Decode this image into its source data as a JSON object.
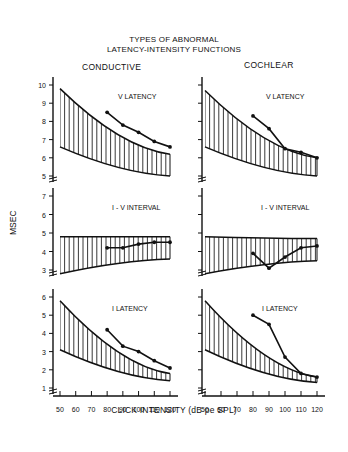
{
  "title": {
    "line1": "TYPES OF ABNORMAL",
    "line2": "LATENCY-INTENSITY FUNCTIONS"
  },
  "columns": {
    "left": "CONDUCTIVE",
    "right": "COCHLEAR"
  },
  "ylabel": "MSEC",
  "xlabel": "CLICK INTENSITY (dB pe SPL)",
  "x_ticks": [
    "50",
    "60",
    "70",
    "80",
    "90",
    "100",
    "110",
    "120"
  ],
  "panels": {
    "v": {
      "label": "V LATENCY",
      "ticks": [
        "10",
        "9",
        "8",
        "7",
        "6",
        "5"
      ]
    },
    "iv": {
      "label": "I - V INTERVAL",
      "ticks": [
        "7",
        "6",
        "5",
        "4",
        "3"
      ]
    },
    "i": {
      "label": "I LATENCY",
      "ticks": [
        "6",
        "5",
        "4",
        "3",
        "2",
        "1"
      ]
    }
  },
  "chart_data": [
    {
      "type": "line",
      "title": "CONDUCTIVE - V LATENCY",
      "xlabel": "CLICK INTENSITY (dB pe SPL)",
      "ylabel": "MSEC",
      "ylim": [
        5,
        10
      ],
      "x": [
        80,
        90,
        100,
        110,
        120
      ],
      "series": [
        {
          "name": "patient",
          "values": [
            8.5,
            7.8,
            7.4,
            6.9,
            6.6
          ]
        }
      ],
      "normal_range": {
        "x": [
          50,
          120
        ],
        "upper": [
          9.8,
          6.2
        ],
        "lower": [
          6.6,
          5.0
        ]
      }
    },
    {
      "type": "line",
      "title": "CONDUCTIVE - I - V INTERVAL",
      "ylim": [
        3,
        7
      ],
      "x": [
        80,
        90,
        100,
        110,
        120
      ],
      "series": [
        {
          "name": "patient",
          "values": [
            4.2,
            4.2,
            4.4,
            4.5,
            4.5
          ]
        }
      ],
      "normal_range": {
        "x": [
          50,
          120
        ],
        "upper": [
          4.8,
          4.8
        ],
        "lower": [
          2.8,
          3.6
        ]
      }
    },
    {
      "type": "line",
      "title": "CONDUCTIVE - I LATENCY",
      "ylim": [
        1,
        6
      ],
      "x": [
        80,
        90,
        100,
        110,
        120
      ],
      "series": [
        {
          "name": "patient",
          "values": [
            4.2,
            3.3,
            3.0,
            2.5,
            2.1
          ]
        }
      ],
      "normal_range": {
        "x": [
          50,
          120
        ],
        "upper": [
          5.8,
          1.8
        ],
        "lower": [
          3.1,
          1.4
        ]
      }
    },
    {
      "type": "line",
      "title": "COCHLEAR - V LATENCY",
      "ylim": [
        5,
        10
      ],
      "x": [
        80,
        90,
        100,
        110,
        120
      ],
      "series": [
        {
          "name": "patient",
          "values": [
            8.3,
            7.6,
            6.5,
            6.3,
            6.0
          ]
        }
      ],
      "normal_range": {
        "x": [
          50,
          120
        ],
        "upper": [
          9.7,
          6.0
        ],
        "lower": [
          6.6,
          5.0
        ]
      }
    },
    {
      "type": "line",
      "title": "COCHLEAR - I - V INTERVAL",
      "ylim": [
        3,
        7
      ],
      "x": [
        80,
        90,
        100,
        110,
        120
      ],
      "series": [
        {
          "name": "patient",
          "values": [
            3.9,
            3.1,
            3.7,
            4.2,
            4.3
          ]
        }
      ],
      "normal_range": {
        "x": [
          50,
          120
        ],
        "upper": [
          4.8,
          4.7
        ],
        "lower": [
          2.8,
          3.5
        ]
      }
    },
    {
      "type": "line",
      "title": "COCHLEAR - I LATENCY",
      "ylim": [
        1,
        6
      ],
      "x": [
        80,
        90,
        100,
        110,
        120
      ],
      "series": [
        {
          "name": "patient",
          "values": [
            5.0,
            4.5,
            2.7,
            1.8,
            1.6
          ]
        }
      ],
      "normal_range": {
        "x": [
          50,
          120
        ],
        "upper": [
          5.8,
          1.6
        ],
        "lower": [
          3.1,
          1.3
        ]
      }
    }
  ]
}
